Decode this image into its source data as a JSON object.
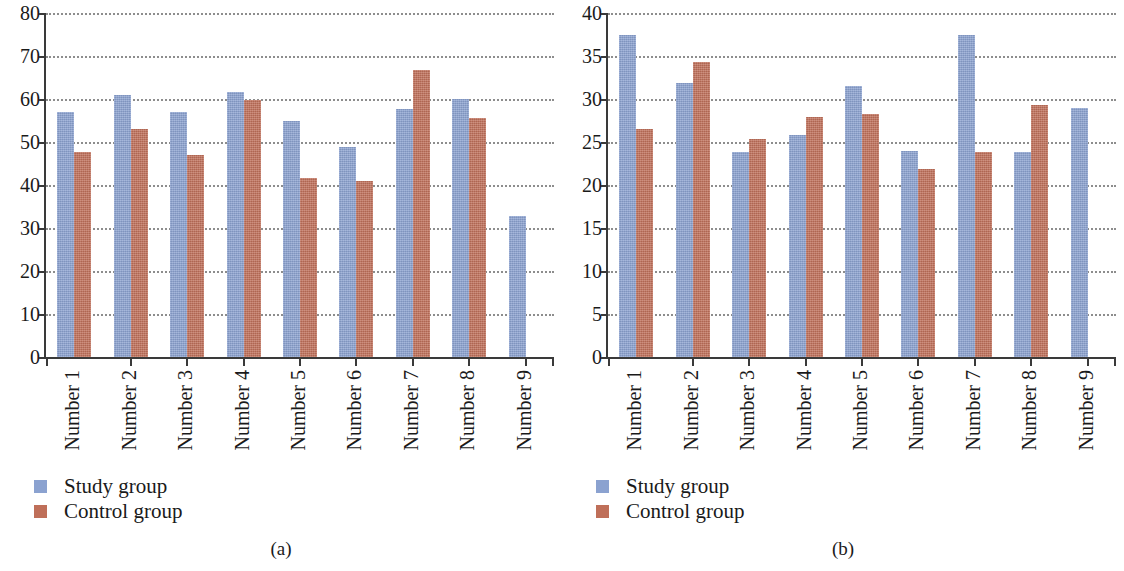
{
  "figure": {
    "panels": [
      {
        "caption": "(a)",
        "chart_data": {
          "type": "bar",
          "title": "",
          "xlabel": "",
          "ylabel": "",
          "ylim": [
            0,
            80
          ],
          "yticks": [
            0,
            10,
            20,
            30,
            40,
            50,
            60,
            70,
            80
          ],
          "ytick_labels": [
            "0",
            "10",
            "20",
            "30",
            "40",
            "50",
            "60",
            "70",
            "80"
          ],
          "grid": true,
          "grid_axis": "y",
          "legend_position": "below-left",
          "categories": [
            "Number 1",
            "Number 2",
            "Number 3",
            "Number 4",
            "Number 5",
            "Number 6",
            "Number 7",
            "Number 8",
            "Number 9"
          ],
          "series": [
            {
              "name": "Study group",
              "color": "#8ba2d0",
              "values": [
                57.0,
                61.0,
                57.0,
                61.7,
                54.8,
                48.8,
                57.6,
                60.0,
                32.9
              ]
            },
            {
              "name": "Control group",
              "color": "#bf6f59",
              "values": [
                47.6,
                53.0,
                47.0,
                59.8,
                41.7,
                41.0,
                66.8,
                55.6,
                null
              ]
            }
          ]
        },
        "legend": [
          {
            "label": "Study group",
            "color": "#8ba2d0"
          },
          {
            "label": "Control group",
            "color": "#bf6f59"
          }
        ]
      },
      {
        "caption": "(b)",
        "chart_data": {
          "type": "bar",
          "title": "",
          "xlabel": "",
          "ylabel": "",
          "ylim": [
            0,
            40
          ],
          "yticks": [
            0,
            5,
            10,
            15,
            20,
            25,
            30,
            35,
            40
          ],
          "ytick_labels": [
            "0",
            "5",
            "10",
            "15",
            "20",
            "25",
            "30",
            "35",
            "40"
          ],
          "grid": true,
          "grid_axis": "y",
          "legend_position": "below-left",
          "categories": [
            "Number 1",
            "Number 2",
            "Number 3",
            "Number 4",
            "Number 5",
            "Number 6",
            "Number 7",
            "Number 8",
            "Number 9"
          ],
          "series": [
            {
              "name": "Study group",
              "color": "#8ba2d0",
              "values": [
                37.5,
                31.9,
                23.8,
                25.8,
                31.5,
                23.9,
                37.5,
                23.8,
                28.9
              ]
            },
            {
              "name": "Control group",
              "color": "#bf6f59",
              "values": [
                26.5,
                34.3,
                25.4,
                27.9,
                28.2,
                21.9,
                23.8,
                29.3,
                null
              ]
            }
          ]
        },
        "legend": [
          {
            "label": "Study group",
            "color": "#8ba2d0"
          },
          {
            "label": "Control group",
            "color": "#bf6f59"
          }
        ]
      }
    ]
  }
}
